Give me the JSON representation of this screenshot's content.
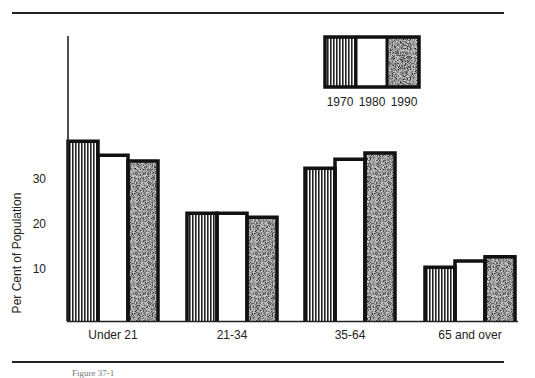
{
  "chart_data": {
    "type": "bar",
    "title": "",
    "xlabel": "",
    "ylabel": "Per Cent of Population",
    "ylim": [
      0,
      40
    ],
    "yticks": [
      10,
      20,
      30
    ],
    "grid": false,
    "legend_position": "top-right",
    "categories": [
      "Under 21",
      "21-34",
      "35-64",
      "65 and over"
    ],
    "series": [
      {
        "name": "1970",
        "pattern": "vertical-stripes",
        "values": [
          38.4,
          22.4,
          32.4,
          10.4
        ]
      },
      {
        "name": "1980",
        "pattern": "white",
        "values": [
          35.3,
          22.4,
          34.4,
          11.8
        ]
      },
      {
        "name": "1990",
        "pattern": "stipple",
        "values": [
          34.0,
          21.5,
          35.8,
          12.7
        ]
      }
    ]
  },
  "caption": "Figure 37-1"
}
